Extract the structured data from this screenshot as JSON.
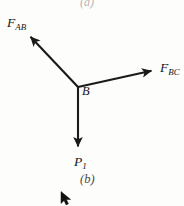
{
  "figure": {
    "caption_top": "(a)",
    "caption_bottom": "(b)",
    "background_color": "#fdfdfb",
    "stroke_color": "#1a1a1a",
    "vertex_label": "B",
    "diagram_type": "free-body-force-diagram"
  },
  "vectors": [
    {
      "name": "F_AB",
      "base_symbol": "F",
      "subscript": "AB",
      "from": [
        78,
        87
      ],
      "to": [
        27,
        33
      ],
      "direction": "up-left",
      "label_x": 7,
      "label_y": 16
    },
    {
      "name": "F_BC",
      "base_symbol": "F",
      "subscript": "BC",
      "from": [
        78,
        87
      ],
      "to": [
        155,
        70
      ],
      "direction": "up-right",
      "label_x": 160,
      "label_y": 61
    },
    {
      "name": "P_1",
      "base_symbol": "P",
      "subscript": "1",
      "from": [
        78,
        87
      ],
      "to": [
        78,
        150
      ],
      "direction": "down",
      "label_x": 74,
      "label_y": 155
    }
  ],
  "cursor": {
    "name": "mouse-pointer",
    "x": 60,
    "y": 191,
    "color": "#111111"
  }
}
